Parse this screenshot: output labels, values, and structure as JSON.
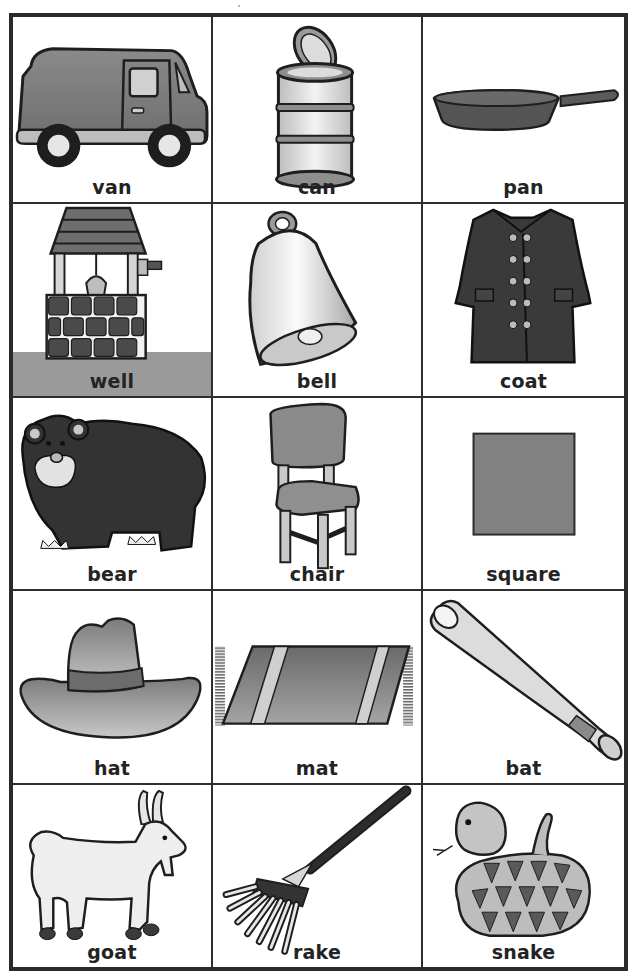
{
  "worksheet": {
    "title": "Picture word cards",
    "colors": {
      "border": "#2a2a2a",
      "dark_fill": "#3c3c3c",
      "mid_fill": "#7f7f7f",
      "light_fill": "#d8d8d8",
      "label_text": "#232323"
    },
    "cards": [
      {
        "word": "van",
        "icon": "van-icon"
      },
      {
        "word": "can",
        "icon": "can-icon"
      },
      {
        "word": "pan",
        "icon": "pan-icon"
      },
      {
        "word": "well",
        "icon": "well-icon"
      },
      {
        "word": "bell",
        "icon": "bell-icon"
      },
      {
        "word": "coat",
        "icon": "coat-icon"
      },
      {
        "word": "bear",
        "icon": "bear-icon"
      },
      {
        "word": "chair",
        "icon": "chair-icon"
      },
      {
        "word": "square",
        "icon": "square-icon"
      },
      {
        "word": "hat",
        "icon": "hat-icon"
      },
      {
        "word": "mat",
        "icon": "mat-icon"
      },
      {
        "word": "bat",
        "icon": "bat-icon"
      },
      {
        "word": "goat",
        "icon": "goat-icon"
      },
      {
        "word": "rake",
        "icon": "rake-icon"
      },
      {
        "word": "snake",
        "icon": "snake-icon"
      }
    ]
  }
}
